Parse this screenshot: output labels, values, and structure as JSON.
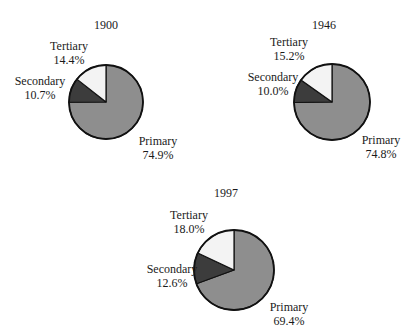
{
  "colors": {
    "primary": "#8e8e8e",
    "secondary": "#3c3c3c",
    "tertiary": "#f3f3f3",
    "outline": "#111111"
  },
  "chart_data": [
    {
      "type": "pie",
      "title": "1900",
      "categories": [
        "Primary",
        "Secondary",
        "Tertiary"
      ],
      "values": [
        74.9,
        10.7,
        14.4
      ],
      "labels": [
        "74.9%",
        "10.7%",
        "14.4%"
      ]
    },
    {
      "type": "pie",
      "title": "1946",
      "categories": [
        "Primary",
        "Secondary",
        "Tertiary"
      ],
      "values": [
        74.8,
        10.0,
        15.2
      ],
      "labels": [
        "74.8%",
        "10.0%",
        "15.2%"
      ]
    },
    {
      "type": "pie",
      "title": "1997",
      "categories": [
        "Primary",
        "Secondary",
        "Tertiary"
      ],
      "values": [
        69.4,
        12.6,
        18.0
      ],
      "labels": [
        "69.4%",
        "12.6%",
        "18.0%"
      ]
    }
  ]
}
